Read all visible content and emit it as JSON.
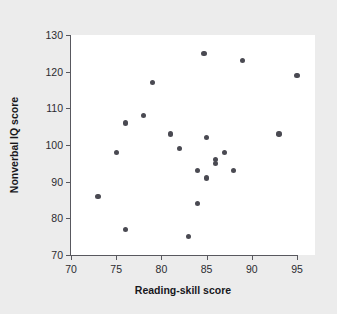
{
  "chart_data": {
    "type": "scatter",
    "title": "",
    "xlabel": "Reading-skill score",
    "ylabel": "Nonverbal IQ score",
    "xlim": [
      70,
      95
    ],
    "ylim": [
      70,
      130
    ],
    "xticks": [
      70,
      75,
      80,
      85,
      90,
      95
    ],
    "yticks": [
      70,
      80,
      90,
      100,
      110,
      120,
      130
    ],
    "grid": false,
    "legend": null,
    "marker_color": "#4a4a52",
    "plot_background": "#ffffff",
    "figure_background": "#ececec",
    "points": [
      {
        "x": 73,
        "y": 86
      },
      {
        "x": 75,
        "y": 98
      },
      {
        "x": 76,
        "y": 106
      },
      {
        "x": 76,
        "y": 77
      },
      {
        "x": 78,
        "y": 108
      },
      {
        "x": 79,
        "y": 117
      },
      {
        "x": 81,
        "y": 103
      },
      {
        "x": 82,
        "y": 99
      },
      {
        "x": 83,
        "y": 75
      },
      {
        "x": 84,
        "y": 93
      },
      {
        "x": 84,
        "y": 84
      },
      {
        "x": 84.7,
        "y": 125
      },
      {
        "x": 85,
        "y": 102
      },
      {
        "x": 85,
        "y": 91
      },
      {
        "x": 86,
        "y": 96
      },
      {
        "x": 86,
        "y": 95
      },
      {
        "x": 87,
        "y": 98
      },
      {
        "x": 88,
        "y": 93
      },
      {
        "x": 89,
        "y": 123
      },
      {
        "x": 93,
        "y": 103
      },
      {
        "x": 95,
        "y": 119
      }
    ]
  }
}
